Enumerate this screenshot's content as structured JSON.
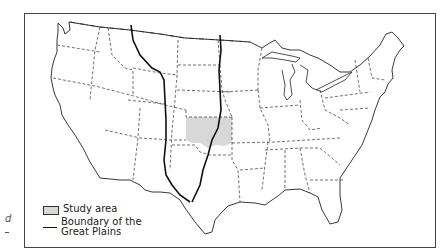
{
  "map": {
    "title": "Conterminous United States",
    "border_color": "#444444",
    "state_line_style": "dashed",
    "international_border_style": "dash-dot"
  },
  "legend": {
    "study_area": {
      "label": "Study area",
      "fill_color": "#d8d8d8"
    },
    "boundary": {
      "label_line1": "Boundary of the",
      "label_line2": "Great Plains",
      "line_color": "#111111"
    }
  },
  "margin": {
    "glyph": "d"
  }
}
